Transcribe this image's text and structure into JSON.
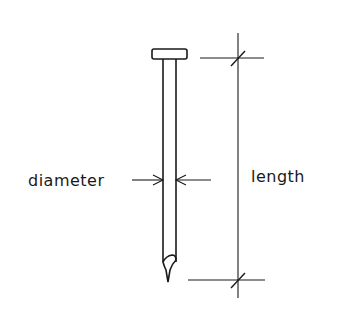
{
  "diagram": {
    "labels": {
      "diameter": "diameter",
      "length": "length"
    },
    "stroke_color": "#1a1a1a",
    "background": "#ffffff"
  }
}
